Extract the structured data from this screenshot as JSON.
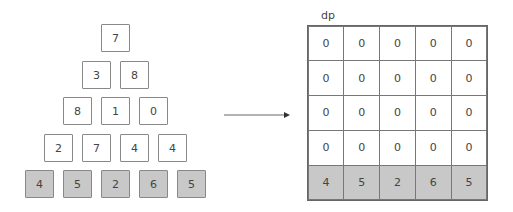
{
  "triangle": {
    "rows": [
      [
        "7"
      ],
      [
        "3",
        "8"
      ],
      [
        "8",
        "1",
        "0"
      ],
      [
        "2",
        "7",
        "4",
        "4"
      ],
      [
        "4",
        "5",
        "2",
        "6",
        "5"
      ]
    ]
  },
  "arrow": {
    "direction": "right"
  },
  "dp": {
    "label": "dp",
    "rows": [
      [
        "0",
        "0",
        "0",
        "0",
        "0"
      ],
      [
        "0",
        "0",
        "0",
        "0",
        "0"
      ],
      [
        "0",
        "0",
        "0",
        "0",
        "0"
      ],
      [
        "0",
        "0",
        "0",
        "0",
        "0"
      ],
      [
        "4",
        "5",
        "2",
        "6",
        "5"
      ]
    ]
  },
  "colors": {
    "base_fill": "#c8c8c8",
    "border": "#888888"
  }
}
